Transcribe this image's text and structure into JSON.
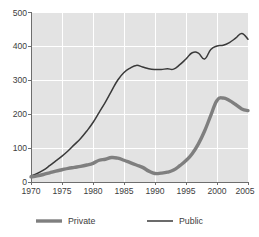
{
  "chart_data": {
    "type": "line",
    "title": "",
    "xlabel": "",
    "ylabel": "",
    "xlim": [
      1970,
      2005
    ],
    "ylim": [
      0,
      500
    ],
    "grid": true,
    "legend_position": "bottom",
    "x": [
      1970,
      1971,
      1972,
      1973,
      1974,
      1975,
      1976,
      1977,
      1978,
      1979,
      1980,
      1981,
      1982,
      1983,
      1984,
      1985,
      1986,
      1987,
      1988,
      1989,
      1990,
      1991,
      1992,
      1993,
      1994,
      1995,
      1996,
      1997,
      1998,
      1999,
      2000,
      2001,
      2002,
      2003,
      2004,
      2005
    ],
    "x_ticks": [
      "1970",
      "1975",
      "1980",
      "1985",
      "1990",
      "1995",
      "2000",
      "2005"
    ],
    "y_ticks": [
      "0",
      "100",
      "200",
      "300",
      "400",
      "500"
    ],
    "series": [
      {
        "name": "Private",
        "color": "#7f7f7f",
        "values": [
          15,
          18,
          22,
          27,
          32,
          36,
          40,
          43,
          46,
          50,
          55,
          64,
          67,
          72,
          70,
          64,
          57,
          50,
          43,
          32,
          25,
          26,
          29,
          35,
          48,
          63,
          83,
          112,
          150,
          196,
          240,
          247,
          240,
          228,
          215,
          210
        ]
      },
      {
        "name": "Public",
        "color": "#3a3a3a",
        "values": [
          18,
          25,
          35,
          48,
          62,
          76,
          92,
          110,
          128,
          150,
          175,
          205,
          235,
          268,
          300,
          322,
          335,
          343,
          338,
          333,
          331,
          331,
          333,
          332,
          345,
          362,
          380,
          379,
          362,
          390,
          400,
          402,
          410,
          423,
          437,
          420
        ]
      }
    ]
  },
  "legend": {
    "items": [
      {
        "label": "Private",
        "color": "#7f7f7f"
      },
      {
        "label": "Public",
        "color": "#3a3a3a"
      }
    ]
  },
  "axes": {
    "y_tick_0": "0",
    "y_tick_1": "100",
    "y_tick_2": "200",
    "y_tick_3": "300",
    "y_tick_4": "400",
    "y_tick_5": "500",
    "x_tick_0": "1970",
    "x_tick_1": "1975",
    "x_tick_2": "1980",
    "x_tick_3": "1985",
    "x_tick_4": "1990",
    "x_tick_5": "1995",
    "x_tick_6": "2000",
    "x_tick_7": "2005"
  }
}
